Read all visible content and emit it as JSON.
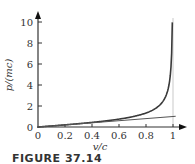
{
  "chart_data": {
    "type": "line",
    "title": "",
    "xlabel": "v/c",
    "ylabel": "p/(mc)",
    "xlim": [
      0,
      1.05
    ],
    "ylim": [
      0,
      10.5
    ],
    "x_ticks": [
      "0",
      "0.2",
      "0.4",
      "0.6",
      "0.8",
      "1"
    ],
    "y_ticks": [
      "0",
      "2",
      "4",
      "6",
      "8",
      "10"
    ],
    "grid": false,
    "legend": null,
    "series": [
      {
        "name": "relativistic momentum p = γmv",
        "color": "#3a3a3a",
        "x": [
          0,
          0.2,
          0.4,
          0.6,
          0.8,
          0.9,
          0.95,
          0.98,
          0.99,
          0.995
        ],
        "y": [
          0,
          0.204,
          0.436,
          0.75,
          1.333,
          2.065,
          3.042,
          4.925,
          7.018,
          9.962
        ]
      },
      {
        "name": "classical momentum p = mv",
        "color": "#555555",
        "x": [
          0,
          1.0
        ],
        "y": [
          0,
          1.0
        ]
      }
    ],
    "annotations": [
      {
        "type": "vertical-asymptote",
        "x": 1.0,
        "color": "#bbbbbb"
      }
    ]
  },
  "caption": "FIGURE 37.14"
}
